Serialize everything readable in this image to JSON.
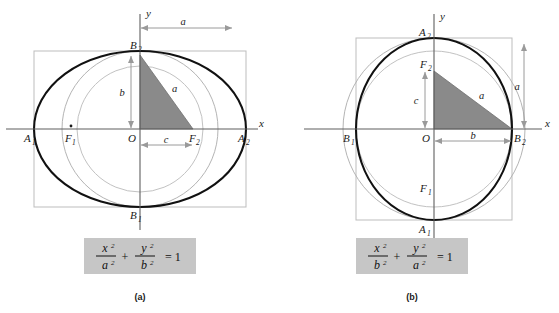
{
  "figure": {
    "colors": {
      "ellipse_stroke": "#111111",
      "circle_stroke": "#b4b4b4",
      "rect_stroke": "#bdbdbd",
      "axis_stroke": "#5f5f5f",
      "triangle_fill": "#8a8a8a",
      "triangle_stroke": "#6f6f6f",
      "dim_arrow": "#9a9a9a",
      "equation_box_bg": "#c6c6c6",
      "text": "#1a1a1a",
      "background": "#ffffff"
    }
  },
  "panel_a": {
    "caption": "(a)",
    "axis_labels": {
      "x": "x",
      "y": "y",
      "origin": "O"
    },
    "points": [
      {
        "name": "A1",
        "base": "A",
        "sub": "1"
      },
      {
        "name": "A2",
        "base": "A",
        "sub": "2"
      },
      {
        "name": "B1",
        "base": "B",
        "sub": "1"
      },
      {
        "name": "B2",
        "base": "B",
        "sub": "2"
      },
      {
        "name": "F1",
        "base": "F",
        "sub": "1"
      },
      {
        "name": "F2",
        "base": "F",
        "sub": "2"
      }
    ],
    "dimensions": [
      {
        "name": "a-top",
        "label": "a",
        "orientation": "horizontal"
      },
      {
        "name": "b-vertical",
        "label": "b",
        "orientation": "vertical"
      },
      {
        "name": "c-horizontal",
        "label": "c",
        "orientation": "horizontal"
      },
      {
        "name": "a-hypotenuse",
        "label": "a",
        "orientation": "diagonal"
      }
    ],
    "equation": {
      "num1": "x",
      "num1_sup": "2",
      "den1": "a",
      "den1_sup": "2",
      "plus": "+",
      "num2": "y",
      "num2_sup": "2",
      "den2": "b",
      "den2_sup": "2",
      "equals": "= 1"
    }
  },
  "panel_b": {
    "caption": "(b)",
    "axis_labels": {
      "x": "x",
      "y": "y",
      "origin": "O"
    },
    "points": [
      {
        "name": "A1",
        "base": "A",
        "sub": "1"
      },
      {
        "name": "A2",
        "base": "A",
        "sub": "2"
      },
      {
        "name": "B1",
        "base": "B",
        "sub": "1"
      },
      {
        "name": "B2",
        "base": "B",
        "sub": "2"
      },
      {
        "name": "F1",
        "base": "F",
        "sub": "1"
      },
      {
        "name": "F2",
        "base": "F",
        "sub": "2"
      }
    ],
    "dimensions": [
      {
        "name": "a-right",
        "label": "a",
        "orientation": "vertical"
      },
      {
        "name": "c-vertical",
        "label": "c",
        "orientation": "vertical"
      },
      {
        "name": "b-horizontal",
        "label": "b",
        "orientation": "horizontal"
      },
      {
        "name": "a-hypotenuse",
        "label": "a",
        "orientation": "diagonal"
      }
    ],
    "equation": {
      "num1": "x",
      "num1_sup": "2",
      "den1": "b",
      "den1_sup": "2",
      "plus": "+",
      "num2": "y",
      "num2_sup": "2",
      "den2": "a",
      "den2_sup": "2",
      "equals": "= 1"
    }
  }
}
